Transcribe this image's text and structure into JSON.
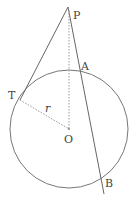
{
  "figure": {
    "type": "geometry",
    "labels": {
      "P": "P",
      "T": "T",
      "A": "A",
      "B": "B",
      "O": "O",
      "r": "r"
    },
    "colors": {
      "stroke": "#666666",
      "dotted": "#999999",
      "text": "#444444"
    }
  }
}
